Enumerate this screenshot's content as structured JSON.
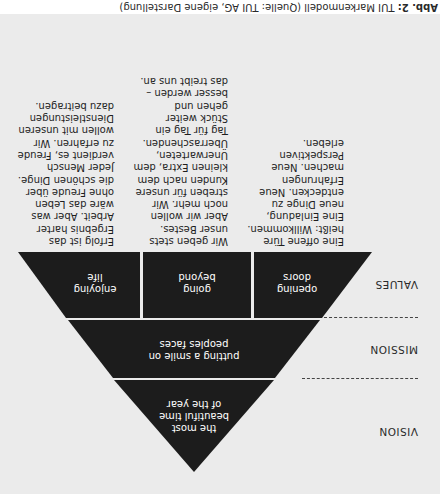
{
  "levels": {
    "vision": {
      "label": "VISION",
      "text_lines": [
        "the most",
        "beautiful time",
        "of the year"
      ]
    },
    "mission": {
      "label": "MISSION",
      "text_lines": [
        "putting a smile on",
        "peoples faces"
      ]
    },
    "values": {
      "label": "VALUES",
      "segments": [
        {
          "lines": [
            "opening",
            "doors"
          ]
        },
        {
          "lines": [
            "going",
            "beyond"
          ]
        },
        {
          "lines": [
            "enjoying",
            "life"
          ]
        }
      ]
    }
  },
  "value_descriptions": [
    {
      "value": "opening doors",
      "text": "Eine offene Türe\nheißt: Willkommen.\nEine Einladung,\nneue Dinge zu\nentdecken. Neue\nErfahrungen\nmachen. Neue\nPerspektiven\nerleben."
    },
    {
      "value": "going beyond",
      "text": "Wir geben stets\nunser Bestes.\nAber wir wollen\nnoch mehr. Wir\nstreben für unsere\nKunden nach dem\nkleinen Extra, dem\nUnerwarteten,\nÜberraschenden.\nTag für Tag ein\nStück weiter\ngehen und\nbesser werden –\ndas treibt uns an."
    },
    {
      "value": "enjoying life",
      "text": "Erfolg ist das\nErgebnis harter\nArbeit. Aber was\nwäre das Leben\nohne Freude über\ndie schönen Dinge.\nJeder Mensch\nverdient es, Freude\nzu erfahren. Wir\nwollen mit unseren\nDienstleistungen\ndazu beitragen."
    }
  ],
  "caption": {
    "prefix": "Abb. 2:",
    "text": " TUI Markenmodell (Quelle: TUI AG, eigene Darstellung)"
  },
  "colors": {
    "shape_fill": "#1c1c1c",
    "background": "#ebebeb",
    "text": "#1e1e1e"
  }
}
